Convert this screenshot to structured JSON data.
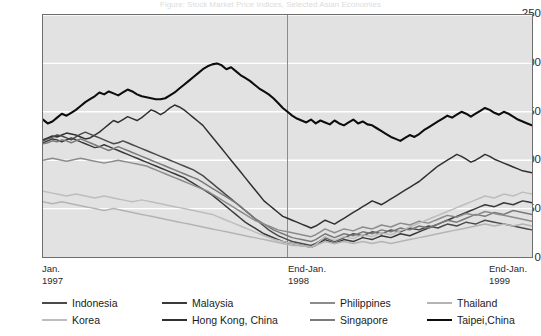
{
  "title_sliver": "Figure: Stock Market Price Indices, Selected Asian Economies",
  "axes": {
    "y_ticks": [
      "250",
      "200",
      "150",
      "100",
      "50",
      "0"
    ],
    "y_min": 0,
    "y_max": 250,
    "x_labels": [
      {
        "line1": "Jan.",
        "line2": "1997"
      },
      {
        "line1": "End-Jan.",
        "line2": "1998"
      },
      {
        "line1": "End-Jan.",
        "line2": "1999"
      }
    ]
  },
  "colors": {
    "plot_background": "#e2e2e2",
    "gridline": "#ffffff",
    "frame": "#6e6e6e",
    "divider": "#8a8a8a",
    "indonesia": "#4a4a4a",
    "malaysia": "#3a3a3a",
    "philippines": "#8c8c8c",
    "thailand": "#b4b4b4",
    "korea": "#bdbdbd",
    "hongkong": "#303030",
    "singapore": "#7a7a7a",
    "taipei": "#0d0d0d"
  },
  "legend": {
    "row1": [
      {
        "label": "Indonesia",
        "key": "indonesia"
      },
      {
        "label": "Malaysia",
        "key": "malaysia"
      },
      {
        "label": "Philippines",
        "key": "philippines"
      },
      {
        "label": "Thailand",
        "key": "thailand"
      }
    ],
    "row2": [
      {
        "label": "Korea",
        "key": "korea"
      },
      {
        "label": "Hong Kong, China",
        "key": "hongkong"
      },
      {
        "label": "Singapore",
        "key": "singapore"
      },
      {
        "label": "Taipei,China",
        "key": "taipei"
      }
    ]
  },
  "chart_data": {
    "type": "line",
    "title": "Stock Market Price Indices, Selected Asian Economies",
    "xlabel": "",
    "ylabel": "",
    "ylim": [
      0,
      250
    ],
    "y_ticks": [
      0,
      50,
      100,
      150,
      200,
      250
    ],
    "grid": true,
    "legend_position": "bottom",
    "x_axis_type": "time",
    "x_start": "Jan. 1997",
    "x_end": "End-Jan. 1999",
    "x_annotations": [
      {
        "label": "End-Jan. 1998",
        "position_fraction": 0.5,
        "style": "vertical-line"
      }
    ],
    "n_points": 105,
    "series": [
      {
        "name": "Taipei,China",
        "color": "#0d0d0d",
        "width": 2.1,
        "values": [
          142,
          138,
          140,
          144,
          148,
          146,
          149,
          152,
          156,
          160,
          163,
          166,
          170,
          168,
          171,
          169,
          167,
          170,
          173,
          171,
          168,
          166,
          165,
          164,
          163,
          163,
          164,
          167,
          170,
          174,
          178,
          182,
          186,
          190,
          194,
          197,
          199,
          200,
          198,
          194,
          196,
          192,
          188,
          185,
          182,
          178,
          174,
          171,
          168,
          164,
          159,
          154,
          150,
          146,
          143,
          141,
          139,
          142,
          138,
          141,
          139,
          137,
          141,
          138,
          136,
          139,
          142,
          138,
          140,
          137,
          136,
          133,
          130,
          127,
          124,
          122,
          120,
          123,
          126,
          124,
          127,
          131,
          134,
          137,
          140,
          143,
          146,
          144,
          147,
          150,
          148,
          145,
          148,
          151,
          154,
          152,
          149,
          147,
          150,
          148,
          145,
          142,
          140,
          138,
          136
        ]
      },
      {
        "name": "Hong Kong, China",
        "color": "#303030",
        "width": 1.5,
        "values": [
          121,
          123,
          125,
          124,
          126,
          128,
          127,
          126,
          124,
          122,
          123,
          126,
          129,
          133,
          137,
          141,
          139,
          142,
          145,
          143,
          141,
          144,
          148,
          152,
          150,
          147,
          150,
          154,
          157,
          155,
          152,
          148,
          144,
          140,
          136,
          130,
          124,
          118,
          112,
          106,
          100,
          94,
          88,
          82,
          76,
          70,
          64,
          58,
          54,
          50,
          46,
          42,
          40,
          38,
          36,
          34,
          32,
          30,
          32,
          35,
          38,
          36,
          34,
          37,
          40,
          43,
          46,
          49,
          52,
          55,
          58,
          56,
          54,
          57,
          60,
          63,
          66,
          69,
          72,
          75,
          78,
          82,
          86,
          90,
          94,
          97,
          100,
          103,
          106,
          104,
          101,
          98,
          100,
          103,
          106,
          104,
          101,
          99,
          97,
          95,
          93,
          91,
          89,
          88,
          87
        ]
      },
      {
        "name": "Indonesia",
        "color": "#4a4a4a",
        "width": 1.5,
        "values": [
          120,
          122,
          124,
          126,
          125,
          123,
          121,
          124,
          127,
          129,
          127,
          125,
          123,
          121,
          119,
          117,
          118,
          120,
          118,
          116,
          114,
          112,
          110,
          108,
          106,
          104,
          102,
          100,
          98,
          96,
          94,
          92,
          90,
          87,
          84,
          80,
          76,
          72,
          68,
          64,
          60,
          56,
          52,
          48,
          44,
          40,
          36,
          32,
          28,
          25,
          22,
          20,
          18,
          16,
          15,
          14,
          13,
          12,
          14,
          17,
          20,
          18,
          16,
          18,
          20,
          22,
          24,
          23,
          22,
          24,
          26,
          25,
          24,
          26,
          28,
          27,
          26,
          28,
          30,
          29,
          28,
          30,
          32,
          31,
          30,
          32,
          34,
          33,
          32,
          34,
          36,
          35,
          34,
          36,
          38,
          37,
          36,
          35,
          34,
          33,
          32,
          31,
          30,
          29,
          28
        ]
      },
      {
        "name": "Malaysia",
        "color": "#3a3a3a",
        "width": 1.5,
        "values": [
          118,
          120,
          122,
          121,
          119,
          121,
          123,
          121,
          119,
          117,
          115,
          113,
          114,
          116,
          114,
          112,
          110,
          108,
          106,
          104,
          102,
          100,
          98,
          96,
          94,
          92,
          90,
          88,
          86,
          84,
          82,
          79,
          76,
          73,
          70,
          67,
          64,
          60,
          56,
          52,
          48,
          44,
          40,
          36,
          33,
          30,
          27,
          24,
          22,
          20,
          18,
          16,
          15,
          14,
          13,
          12,
          11,
          10,
          12,
          15,
          18,
          16,
          14,
          16,
          18,
          17,
          16,
          18,
          20,
          19,
          18,
          20,
          22,
          21,
          20,
          22,
          24,
          23,
          22,
          24,
          26,
          28,
          30,
          32,
          34,
          36,
          38,
          40,
          42,
          44,
          46,
          48,
          50,
          52,
          54,
          53,
          52,
          54,
          56,
          55,
          54,
          56,
          58,
          57,
          56
        ]
      },
      {
        "name": "Singapore",
        "color": "#7a7a7a",
        "width": 1.5,
        "values": [
          117,
          118,
          120,
          119,
          121,
          120,
          118,
          120,
          122,
          120,
          118,
          116,
          114,
          112,
          110,
          112,
          114,
          112,
          110,
          108,
          106,
          104,
          102,
          100,
          98,
          96,
          94,
          92,
          90,
          88,
          86,
          84,
          82,
          80,
          77,
          74,
          71,
          68,
          65,
          62,
          59,
          56,
          52,
          48,
          44,
          40,
          37,
          34,
          31,
          28,
          26,
          24,
          22,
          20,
          19,
          18,
          17,
          16,
          18,
          21,
          24,
          22,
          20,
          22,
          24,
          23,
          22,
          24,
          26,
          25,
          24,
          26,
          28,
          27,
          26,
          28,
          30,
          29,
          28,
          30,
          32,
          31,
          30,
          32,
          34,
          36,
          38,
          37,
          36,
          38,
          40,
          42,
          44,
          43,
          42,
          44,
          46,
          45,
          44,
          46,
          48,
          47,
          46,
          45,
          44
        ]
      },
      {
        "name": "Philippines",
        "color": "#8c8c8c",
        "width": 1.5,
        "values": [
          100,
          101,
          102,
          101,
          100,
          99,
          100,
          101,
          102,
          101,
          100,
          99,
          98,
          97,
          98,
          99,
          100,
          99,
          98,
          97,
          96,
          95,
          94,
          92,
          90,
          88,
          86,
          84,
          82,
          80,
          78,
          76,
          74,
          72,
          70,
          68,
          65,
          62,
          59,
          56,
          53,
          50,
          47,
          44,
          41,
          38,
          36,
          34,
          32,
          30,
          28,
          27,
          26,
          25,
          24,
          23,
          22,
          21,
          23,
          26,
          29,
          27,
          25,
          27,
          29,
          28,
          27,
          29,
          31,
          30,
          29,
          31,
          33,
          32,
          31,
          33,
          35,
          34,
          33,
          35,
          37,
          36,
          35,
          37,
          39,
          41,
          43,
          42,
          41,
          43,
          45,
          44,
          43,
          45,
          47,
          46,
          45,
          44,
          43,
          42,
          41,
          40,
          39,
          38,
          37
        ]
      },
      {
        "name": "Korea",
        "color": "#bdbdbd",
        "width": 1.5,
        "values": [
          68,
          67,
          66,
          65,
          64,
          63,
          64,
          65,
          64,
          63,
          62,
          61,
          62,
          63,
          62,
          61,
          60,
          59,
          58,
          57,
          58,
          59,
          58,
          57,
          56,
          55,
          54,
          53,
          52,
          51,
          50,
          49,
          48,
          47,
          46,
          45,
          44,
          42,
          40,
          38,
          36,
          34,
          32,
          30,
          28,
          26,
          24,
          22,
          20,
          18,
          17,
          16,
          15,
          14,
          13,
          12,
          11,
          10,
          13,
          17,
          21,
          19,
          17,
          19,
          21,
          20,
          19,
          21,
          23,
          22,
          21,
          23,
          25,
          24,
          23,
          25,
          27,
          29,
          31,
          33,
          35,
          37,
          39,
          41,
          43,
          45,
          47,
          49,
          51,
          53,
          55,
          57,
          59,
          61,
          63,
          62,
          61,
          63,
          65,
          64,
          63,
          65,
          67,
          66,
          65
        ]
      },
      {
        "name": "Thailand",
        "color": "#b4b4b4",
        "width": 1.5,
        "values": [
          57,
          56,
          55,
          56,
          57,
          56,
          55,
          54,
          53,
          52,
          51,
          50,
          49,
          48,
          49,
          50,
          49,
          48,
          47,
          46,
          45,
          44,
          43,
          42,
          41,
          40,
          39,
          38,
          37,
          36,
          35,
          34,
          33,
          32,
          31,
          30,
          29,
          28,
          27,
          26,
          25,
          24,
          23,
          22,
          21,
          20,
          19,
          18,
          17,
          16,
          15,
          14,
          13,
          12,
          12,
          11,
          11,
          10,
          12,
          14,
          16,
          15,
          14,
          15,
          16,
          15,
          14,
          15,
          16,
          15,
          14,
          15,
          16,
          15,
          14,
          15,
          16,
          17,
          18,
          19,
          20,
          21,
          22,
          23,
          24,
          25,
          26,
          27,
          28,
          29,
          30,
          31,
          32,
          33,
          34,
          33,
          32,
          33,
          34,
          33,
          32,
          33,
          34,
          33,
          32
        ]
      }
    ]
  }
}
